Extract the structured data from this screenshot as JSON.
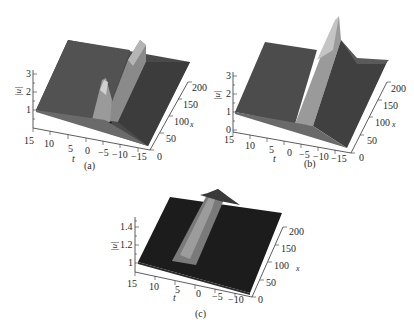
{
  "figure": {
    "panels": [
      {
        "id": "a",
        "caption": "(a)",
        "z_label": "|u|",
        "t_label": "t",
        "x_label": "x",
        "z_ticks": [
          "1",
          "2",
          "3"
        ],
        "t_ticks": [
          "15",
          "10",
          "5",
          "0",
          "−5",
          "−10",
          "−15"
        ],
        "x_ticks": [
          "0",
          "50",
          "100",
          "150",
          "200"
        ],
        "description": "Background level |u|=1 with a localized peak near t≈0 small x (two dips below) evolving into a tall ridge along x"
      },
      {
        "id": "b",
        "caption": "(b)",
        "z_label": "|u|",
        "t_label": "t",
        "x_label": "x",
        "z_ticks": [
          "0",
          "1",
          "2",
          "3"
        ],
        "t_ticks": [
          "15",
          "10",
          "5",
          "0",
          "−5",
          "−10",
          "−15"
        ],
        "x_ticks": [
          "0",
          "50",
          "100",
          "150",
          "200"
        ],
        "description": "Background |u|=1 with a ridge growing along x, reaching maximum near x=200"
      },
      {
        "id": "c",
        "caption": "(c)",
        "z_label": "|u|",
        "t_label": "t",
        "x_label": "x",
        "z_ticks": [
          "1",
          "1.2",
          "1.4"
        ],
        "t_ticks": [
          "15",
          "10",
          "5",
          "0",
          "−5",
          "−10"
        ],
        "x_ticks": [
          "0",
          "50",
          "100",
          "150",
          "200"
        ],
        "description": "Background |u|=1 with a smooth soliton ridge of height ~1.5 along x"
      }
    ]
  },
  "colors": {
    "surface_dark": "#3a3a3a",
    "surface_mid": "#555555",
    "ridge_light": "#9a9a9a",
    "ridge_highlight": "#c8c8c8",
    "surface_c": "#1a1a1a",
    "axis": "#333333"
  }
}
